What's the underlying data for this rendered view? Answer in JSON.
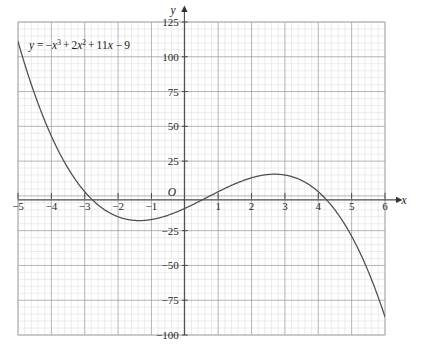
{
  "figure": {
    "equation_label": "y = −x³ + 2x² + 11x − 9",
    "origin_label": "O",
    "x_axis_name": "x",
    "y_axis_name": "y"
  },
  "chart_data": {
    "type": "line",
    "title": "",
    "subtitle": "",
    "xlabel": "x",
    "ylabel": "y",
    "equation": "y = -x^3 + 2x^2 + 11x - 9",
    "grid": true,
    "grid_minor_per_major": 5,
    "legend": "none",
    "legend_position": "none",
    "annotations": [
      "y = −x³ + 2x² + 11x − 9"
    ],
    "xlim": [
      -5,
      6
    ],
    "ylim": [
      -100,
      125
    ],
    "x_major_step": 1,
    "y_major_step": 25,
    "xticks": [
      -5,
      -4,
      -3,
      -2,
      -1,
      1,
      2,
      3,
      4,
      5,
      6
    ],
    "xtick_labels": [
      "−5",
      "−4",
      "−3",
      "−2",
      "−1",
      "1",
      "2",
      "3",
      "4",
      "5",
      "6"
    ],
    "yticks": [
      125,
      100,
      75,
      50,
      25,
      -25,
      -50,
      -75,
      -100
    ],
    "ytick_labels": [
      "125",
      "100",
      "75",
      "50",
      "25",
      "−25",
      "−50",
      "−75",
      "−100"
    ],
    "series": [
      {
        "name": "y = -x^3 + 2x^2 + 11x - 9",
        "color": "#4d4d4d",
        "x": [
          -5,
          -4.8,
          -4.6,
          -4.4,
          -4.2,
          -4,
          -3.8,
          -3.6,
          -3.4,
          -3.2,
          -3,
          -2.8,
          -2.6,
          -2.4,
          -2.2,
          -2,
          -1.8,
          -1.6,
          -1.4,
          -1.2,
          -1,
          -0.8,
          -0.6,
          -0.4,
          -0.2,
          0,
          0.2,
          0.4,
          0.6,
          0.8,
          1,
          1.2,
          1.4,
          1.6,
          1.8,
          2,
          2.2,
          2.4,
          2.6,
          2.8,
          3,
          3.2,
          3.4,
          3.6,
          3.8,
          4,
          4.2,
          4.4,
          4.6,
          4.8,
          5,
          5.2,
          5.4,
          5.6,
          5.8,
          6
        ],
        "y": [
          111,
          100.1,
          89.8,
          80.1,
          71,
          62.4,
          54.4,
          47,
          40.1,
          33.7,
          27.9,
          22.6,
          17.8,
          13.5,
          9.7,
          6.3,
          3.4,
          1,
          -1.1,
          -2.7,
          -4,
          -4.9,
          -5.5,
          -5.8,
          -5.9,
          -5.9,
          -5.7,
          -5.4,
          -5,
          -4.5,
          -4,
          -3.4,
          -2.8,
          -2.1,
          -1.4,
          -0.6,
          0.3,
          1.2,
          2.2,
          3.2,
          4.2,
          5.1,
          5.9,
          6.5,
          6.8,
          6.9,
          6.6,
          6,
          4.9,
          3.3,
          1.3,
          -1.3,
          -4.5,
          -8.3,
          -12.9,
          -18.2
        ]
      }
    ],
    "key_points": {
      "local_minimum": {
        "x": -1.63,
        "y": -15.1
      },
      "local_maximum": {
        "x": 2.63,
        "y": 20.2
      },
      "y_intercept": {
        "x": 0,
        "y": -9
      },
      "x_intercepts": [
        -2.78,
        0.85,
        3.93
      ],
      "left_endpoint": {
        "x": -5,
        "y": 111
      },
      "right_endpoint": {
        "x": 6,
        "y": -87
      }
    },
    "colors": {
      "curve": "#4d4d4d",
      "axis": "#4a4a4a",
      "grid_major": "#9c9c9c",
      "grid_minor": "#e3dede",
      "background": "#ffffff",
      "text": "#1a1a1a"
    }
  }
}
